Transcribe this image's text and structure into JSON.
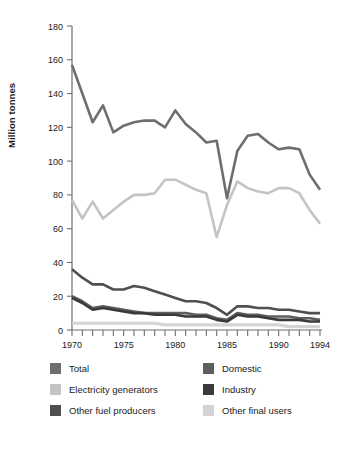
{
  "chart_data": {
    "type": "line",
    "title": "",
    "xlabel": "",
    "ylabel": "Million tonnes",
    "xlim": [
      1970,
      1994
    ],
    "ylim": [
      0,
      180
    ],
    "y_ticks": [
      0,
      20,
      40,
      60,
      80,
      100,
      120,
      140,
      160,
      180
    ],
    "x_ticks_labeled": [
      1970,
      1975,
      1980,
      1985,
      1990,
      1994
    ],
    "x": [
      1970,
      1971,
      1972,
      1973,
      1974,
      1975,
      1976,
      1977,
      1978,
      1979,
      1980,
      1981,
      1982,
      1983,
      1984,
      1985,
      1986,
      1987,
      1988,
      1989,
      1990,
      1991,
      1992,
      1993,
      1994
    ],
    "grid": false,
    "legend_position": "bottom",
    "series": [
      {
        "name": "Total",
        "color": "#6e6e6e",
        "values": [
          157,
          140,
          123,
          133,
          117,
          121,
          123,
          124,
          124,
          120,
          130,
          122,
          117,
          111,
          112,
          78,
          106,
          115,
          116,
          111,
          107,
          108,
          107,
          92,
          83
        ]
      },
      {
        "name": "Electricity generators",
        "color": "#c4c4c4",
        "values": [
          77,
          66,
          76,
          66,
          71,
          76,
          80,
          80,
          81,
          89,
          89,
          86,
          83,
          81,
          55,
          74,
          88,
          84,
          82,
          81,
          84,
          84,
          81,
          71,
          63
        ]
      },
      {
        "name": "Other fuel producers",
        "color": "#4f4f4f",
        "values": [
          36,
          31,
          27,
          27,
          24,
          24,
          26,
          25,
          23,
          21,
          19,
          17,
          17,
          16,
          13,
          9,
          14,
          14,
          13,
          13,
          12,
          12,
          11,
          10,
          10
        ]
      },
      {
        "name": "Domestic",
        "color": "#5e5e5e",
        "values": [
          20,
          17,
          13,
          14,
          13,
          12,
          11,
          10,
          10,
          10,
          10,
          10,
          9,
          9,
          7,
          6,
          10,
          9,
          9,
          8,
          8,
          8,
          7,
          7,
          6
        ]
      },
      {
        "name": "Industry",
        "color": "#3a3a3a",
        "values": [
          19,
          16,
          12,
          13,
          12,
          11,
          10,
          10,
          9,
          9,
          9,
          8,
          8,
          8,
          6,
          5,
          9,
          8,
          8,
          7,
          6,
          6,
          6,
          5,
          5
        ]
      },
      {
        "name": "Other final users",
        "color": "#d4d4d4",
        "values": [
          4,
          4,
          4,
          4,
          4,
          4,
          4,
          4,
          4,
          3,
          3,
          3,
          3,
          3,
          3,
          3,
          3,
          3,
          3,
          3,
          3,
          2,
          2,
          2,
          2
        ]
      }
    ]
  },
  "legend": {
    "left_items": [
      {
        "label": "Total",
        "color": "#6e6e6e",
        "swatch_name": "legend-swatch-total"
      },
      {
        "label": "Electricity generators",
        "color": "#c4c4c4",
        "swatch_name": "legend-swatch-electricity-generators"
      },
      {
        "label": "Other fuel producers",
        "color": "#4f4f4f",
        "swatch_name": "legend-swatch-other-fuel-producers"
      }
    ],
    "right_items": [
      {
        "label": "Domestic",
        "color": "#5e5e5e",
        "swatch_name": "legend-swatch-domestic"
      },
      {
        "label": "Industry",
        "color": "#3a3a3a",
        "swatch_name": "legend-swatch-industry"
      },
      {
        "label": "Other final users",
        "color": "#d4d4d4",
        "swatch_name": "legend-swatch-other-final-users"
      }
    ]
  }
}
